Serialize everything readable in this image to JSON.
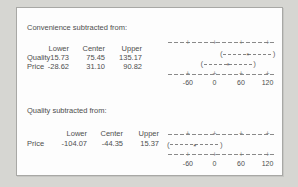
{
  "window": {
    "background": "#d6d6d2"
  },
  "panel": {
    "background": "#fdfdfd",
    "border_color": "#a8a8a5"
  },
  "colors": {
    "text": "#4e4e4e",
    "plot_line": "#8a8a8a"
  },
  "sections": [
    {
      "title": "Convenience subtracted from:",
      "columns": [
        "Lower",
        "Center",
        "Upper"
      ],
      "rows": [
        {
          "label": "Quality",
          "lower": "15.73",
          "center": "75.45",
          "upper": "135.17"
        },
        {
          "label": "Price",
          "lower": "-28.62",
          "center": "31.10",
          "upper": "90.82"
        }
      ]
    },
    {
      "title": "Quality subtracted from:",
      "columns": [
        "Lower",
        "Center",
        "Upper"
      ],
      "rows": [
        {
          "label": "Price",
          "lower": "-104.07",
          "center": "-44.35",
          "upper": "15.37"
        }
      ]
    }
  ],
  "chart_data": [
    {
      "type": "interval",
      "title": "Convenience subtracted from:",
      "series": [
        {
          "name": "Quality",
          "lower": 15.73,
          "center": 75.45,
          "upper": 135.17
        },
        {
          "name": "Price",
          "lower": -28.62,
          "center": 31.1,
          "upper": 90.82
        }
      ],
      "xticks": [
        -60,
        0,
        60,
        120
      ],
      "xlim": [
        -105,
        137
      ],
      "xlabel": "",
      "grid": false,
      "legend": "none"
    },
    {
      "type": "interval",
      "title": "Quality subtracted from:",
      "series": [
        {
          "name": "Price",
          "lower": -104.07,
          "center": -44.35,
          "upper": 15.37
        }
      ],
      "xticks": [
        -60,
        0,
        60,
        120
      ],
      "xlim": [
        -105,
        137
      ],
      "xlabel": "",
      "grid": false,
      "legend": "none"
    }
  ]
}
